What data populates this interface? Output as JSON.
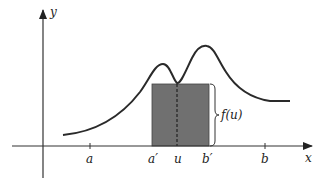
{
  "diagram": {
    "axes": {
      "x_label": "x",
      "y_label": "y"
    },
    "ticks": [
      {
        "label": "a",
        "x": 90
      },
      {
        "label": "a′",
        "x": 154
      },
      {
        "label": "u",
        "x": 178
      },
      {
        "label": "b′",
        "x": 207
      },
      {
        "label": "b",
        "x": 265
      }
    ],
    "rectangle": {
      "fill": "#6e6e6e",
      "left_label": "a′",
      "right_label": "b′",
      "height_label": "f(u)"
    },
    "colors": {
      "curve": "#2a2a2a",
      "axes": "#333333",
      "rect_fill": "#707070",
      "background": "#ffffff"
    }
  }
}
